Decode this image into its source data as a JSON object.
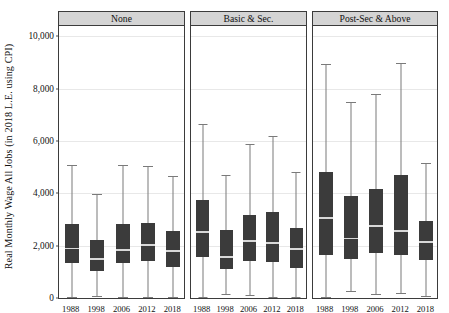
{
  "chart_data": {
    "type": "box",
    "title": "",
    "xlabel": "",
    "ylabel": "Real Monthly Wage All Jobs (in 2018 L.E. using CPI)",
    "ylim": [
      0,
      10400
    ],
    "yticks": [
      0,
      2000,
      4000,
      6000,
      8000,
      10000
    ],
    "ytick_labels": [
      "0",
      "2,000",
      "4,000",
      "6,000",
      "8,000",
      "10,000"
    ],
    "grid": true,
    "legend": "none",
    "categories": [
      "1988",
      "1998",
      "2006",
      "2012",
      "2018"
    ],
    "panel_labels": [
      "None",
      "Basic & Sec.",
      "Post-Sec & Above"
    ],
    "panels": [
      {
        "label": "None",
        "boxes": [
          {
            "category": "1988",
            "whisker_low": 40,
            "q1": 1330,
            "median": 1890,
            "q3": 2830,
            "whisker_high": 5100
          },
          {
            "category": "1998",
            "whisker_low": 70,
            "q1": 1050,
            "median": 1490,
            "q3": 2230,
            "whisker_high": 3990
          },
          {
            "category": "2006",
            "whisker_low": 40,
            "q1": 1320,
            "median": 1840,
            "q3": 2820,
            "whisker_high": 5070
          },
          {
            "category": "2012",
            "whisker_low": 30,
            "q1": 1420,
            "median": 2030,
            "q3": 2880,
            "whisker_high": 5030
          },
          {
            "category": "2018",
            "whisker_low": 20,
            "q1": 1200,
            "median": 1800,
            "q3": 2570,
            "whisker_high": 4650
          }
        ]
      },
      {
        "label": "Basic & Sec.",
        "boxes": [
          {
            "category": "1988",
            "whisker_low": 40,
            "q1": 1550,
            "median": 2530,
            "q3": 3740,
            "whisker_high": 6650
          },
          {
            "category": "1998",
            "whisker_low": 140,
            "q1": 1120,
            "median": 1570,
            "q3": 2600,
            "whisker_high": 4710
          },
          {
            "category": "2006",
            "whisker_low": 100,
            "q1": 1400,
            "median": 2180,
            "q3": 3180,
            "whisker_high": 5870
          },
          {
            "category": "2012",
            "whisker_low": 40,
            "q1": 1390,
            "median": 2110,
            "q3": 3290,
            "whisker_high": 6180
          },
          {
            "category": "2018",
            "whisker_low": 30,
            "q1": 1130,
            "median": 1880,
            "q3": 2670,
            "whisker_high": 4830
          }
        ]
      },
      {
        "label": "Post-Sec & Above",
        "boxes": [
          {
            "category": "1988",
            "whisker_low": 40,
            "q1": 1630,
            "median": 3060,
            "q3": 4810,
            "whisker_high": 8930
          },
          {
            "category": "1998",
            "whisker_low": 280,
            "q1": 1490,
            "median": 2270,
            "q3": 3910,
            "whisker_high": 7490
          },
          {
            "category": "2006",
            "whisker_low": 140,
            "q1": 1720,
            "median": 2750,
            "q3": 4180,
            "whisker_high": 7800
          },
          {
            "category": "2012",
            "whisker_low": 200,
            "q1": 1660,
            "median": 2560,
            "q3": 4710,
            "whisker_high": 8980
          },
          {
            "category": "2018",
            "whisker_low": 70,
            "q1": 1470,
            "median": 2140,
            "q3": 2950,
            "whisker_high": 5150
          }
        ]
      }
    ],
    "colors": {
      "box_fill": "#3b3b3b",
      "median_line": "#d8d8d8",
      "whisker": "#7a7a7a",
      "gridline": "#e8e8e8",
      "panel_strip": "#d4d4d4",
      "panel_border": "#3b3b3b",
      "text": "#111111",
      "background": "#ffffff"
    }
  }
}
